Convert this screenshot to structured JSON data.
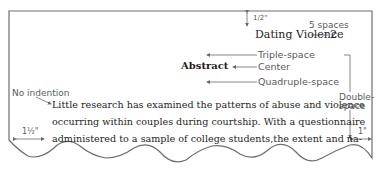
{
  "page": {
    "running_head": "Dating Violence",
    "page_number": "2",
    "heading": "Abstract",
    "body_lines": [
      "Little research has examined the patterns of abuse and violence",
      "occurring within couples during courtship. With a questionnaire",
      "administered to a sample of college students,the extent and na-"
    ]
  },
  "annotations": {
    "top_margin": "1/2\"",
    "five_spaces": "5 spaces",
    "triple_space": "Triple-space",
    "center": "Center",
    "quadruple_space": "Quadruple-space",
    "double_space_1": "Double-",
    "double_space_2": "space",
    "no_indention": "No indention",
    "left_margin": "1½\"",
    "right_margin": "1\""
  },
  "colors": {
    "border": "#6e6e6e",
    "text": "#1e1e1e",
    "annotation": "#5a5a5a",
    "arrow": "#6a6a6a"
  }
}
